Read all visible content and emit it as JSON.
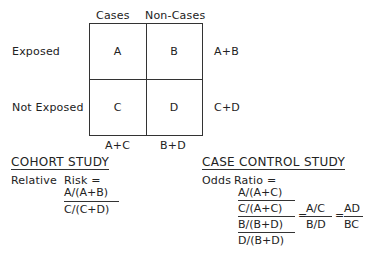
{
  "table": {
    "col_headers": [
      "Cases",
      "Non-Cases"
    ],
    "row_headers": [
      "Exposed",
      "Not Exposed"
    ],
    "cells": [
      [
        "A",
        "B"
      ],
      [
        "C",
        "D"
      ]
    ],
    "row_totals": [
      "A+B",
      "C+D"
    ],
    "col_totals": [
      "A+C",
      "B+D"
    ]
  },
  "cohort": {
    "title": "COHORT STUDY",
    "label1": "Relative",
    "label2": "Risk =",
    "numerator": "A/(A+B)",
    "denominator": "C/(C+D)"
  },
  "case_control": {
    "title": "CASE CONTROL STUDY",
    "label1": "Odds",
    "label2": "Ratio =",
    "top_num": "A/(A+C)",
    "top_den": "C/(A+C)",
    "bot_num": "B/(B+D)",
    "bot_den": "D/(B+D)",
    "eq1": "=",
    "mid_num": "A/C",
    "mid_den": "B/D",
    "eq2": "=",
    "final_num": "AD",
    "final_den": "BC"
  }
}
